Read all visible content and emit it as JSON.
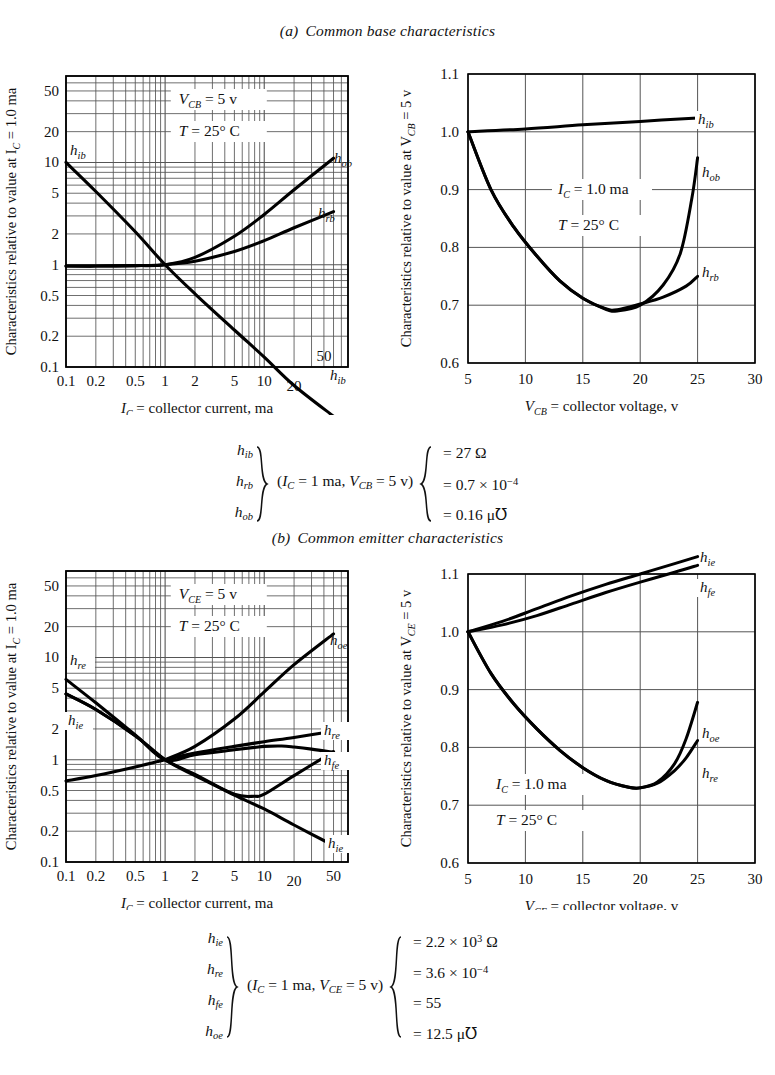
{
  "figure": {
    "panels": [
      {
        "id": "a",
        "label": "(a)",
        "title": "Common base characteristics",
        "left_chart": {
          "ylabel": "Characteristics relative to value at I",
          "ylabel_sub": "C",
          "ylabel_tail": " = 1.0 ma",
          "xlabel": "I",
          "xlabel_sub": "C",
          "xlabel_tail": " = collector current, ma",
          "annotations": [
            {
              "text": "V",
              "sub": "CB",
              "tail": " = 5 v"
            },
            {
              "text": "T",
              "sub": "",
              "tail": " = 25° C"
            }
          ],
          "xticks": [
            "0.1",
            "0.2",
            "0.5",
            "1",
            "2",
            "5",
            "10",
            "20",
            "50"
          ],
          "yticks": [
            "0.1",
            "0.2",
            "0.5",
            "1",
            "2",
            "5",
            "10",
            "20",
            "50"
          ],
          "curve_labels": [
            "h_ib",
            "h_ob",
            "h_rb",
            "h_ib"
          ]
        },
        "right_chart": {
          "ylabel": "Characteristics relative to value at V",
          "ylabel_sub": "CB",
          "ylabel_tail": " = 5 v",
          "xlabel": "V",
          "xlabel_sub": "CB",
          "xlabel_tail": " = collector voltage, v",
          "annotations": [
            {
              "text": "I",
              "sub": "C",
              "tail": " = 1.0 ma"
            },
            {
              "text": "T",
              "sub": "",
              "tail": " = 25° C"
            }
          ],
          "xticks": [
            "5",
            "10",
            "15",
            "20",
            "25",
            "30"
          ],
          "yticks": [
            "0.6",
            "0.7",
            "0.8",
            "0.9",
            "1.0",
            "1.1"
          ],
          "curve_labels": [
            "h_ib",
            "h_ob",
            "h_rb"
          ]
        },
        "legend": {
          "params": [
            {
              "h": "h",
              "sub": "ib"
            },
            {
              "h": "h",
              "sub": "rb"
            },
            {
              "h": "h",
              "sub": "ob"
            }
          ],
          "condition_pre": "(I",
          "condition_sub1": "C",
          "condition_mid": " = 1 ma, V",
          "condition_sub2": "CB",
          "condition_post": " = 5 v)",
          "values": [
            {
              "eq": "= 27 Ω"
            },
            {
              "eq": "= 0.7 × 10",
              "sup": "−4"
            },
            {
              "eq": "= 0.16 μ℧"
            }
          ]
        }
      },
      {
        "id": "b",
        "label": "(b)",
        "title": "Common emitter characteristics",
        "left_chart": {
          "ylabel": "Characteristics relative to value at I",
          "ylabel_sub": "C",
          "ylabel_tail": " = 1.0 ma",
          "xlabel": "I",
          "xlabel_sub": "C",
          "xlabel_tail": " = collector current, ma",
          "annotations": [
            {
              "text": "V",
              "sub": "CE",
              "tail": " = 5 v"
            },
            {
              "text": "T",
              "sub": "",
              "tail": " = 25° C"
            }
          ],
          "xticks": [
            "0.1",
            "0.2",
            "0.5",
            "1",
            "2",
            "5",
            "10",
            "20",
            "50"
          ],
          "yticks": [
            "0.1",
            "0.2",
            "0.5",
            "1",
            "2",
            "5",
            "10",
            "20",
            "50"
          ],
          "curve_labels": [
            "h_re",
            "h_ie",
            "h_oe",
            "h_re",
            "h_fe",
            "h_ie"
          ]
        },
        "right_chart": {
          "ylabel": "Characteristics relative to value at V",
          "ylabel_sub": "CE",
          "ylabel_tail": " = 5 v",
          "xlabel": "V",
          "xlabel_sub": "CE",
          "xlabel_tail": " = collector voltage, v",
          "annotations": [
            {
              "text": "I",
              "sub": "C",
              "tail": " = 1.0 ma"
            },
            {
              "text": "T",
              "sub": "",
              "tail": " = 25° C"
            }
          ],
          "xticks": [
            "5",
            "10",
            "15",
            "20",
            "25",
            "30"
          ],
          "yticks": [
            "0.6",
            "0.7",
            "0.8",
            "0.9",
            "1.0",
            "1.1"
          ],
          "curve_labels": [
            "h_ie",
            "h_fe",
            "h_oe",
            "h_re"
          ]
        },
        "legend": {
          "params": [
            {
              "h": "h",
              "sub": "ie"
            },
            {
              "h": "h",
              "sub": "re"
            },
            {
              "h": "h",
              "sub": "fe"
            },
            {
              "h": "h",
              "sub": "oe"
            }
          ],
          "condition_pre": "(I",
          "condition_sub1": "C",
          "condition_mid": " = 1 ma, V",
          "condition_sub2": "CE",
          "condition_post": " = 5 v)",
          "values": [
            {
              "eq": "= 2.2 × 10",
              "sup": "3",
              "tail": " Ω"
            },
            {
              "eq": "= 3.6 × 10",
              "sup": "−4"
            },
            {
              "eq": "= 55"
            },
            {
              "eq": "= 12.5 μ℧"
            }
          ]
        }
      }
    ]
  },
  "chart_data": [
    {
      "id": "a-left",
      "type": "line",
      "title": "Common base characteristics — vs collector current",
      "xlabel": "I_C = collector current, ma",
      "ylabel": "Characteristics relative to value at I_C = 1.0 ma",
      "xscale": "log",
      "yscale": "log",
      "xlim": [
        0.1,
        70
      ],
      "ylim": [
        0.1,
        70
      ],
      "xticks": [
        0.1,
        0.2,
        0.5,
        1,
        2,
        5,
        10,
        20,
        50
      ],
      "yticks": [
        0.1,
        0.2,
        0.5,
        1,
        2,
        5,
        10,
        20,
        50
      ],
      "grid": true,
      "annotations": [
        "V_CB = 5 v",
        "T = 25° C"
      ],
      "series": [
        {
          "name": "h_ib",
          "label_left": "h_ib",
          "label_right": "h_ib",
          "x": [
            0.1,
            0.2,
            0.5,
            1,
            2,
            5,
            10,
            20,
            50
          ],
          "y": [
            10.0,
            5.2,
            2.1,
            1.0,
            0.52,
            0.23,
            0.125,
            0.066,
            0.033
          ]
        },
        {
          "name": "h_ob",
          "label_right": "h_ob",
          "x": [
            0.1,
            0.2,
            0.5,
            1,
            2,
            5,
            10,
            20,
            50
          ],
          "y": [
            0.97,
            0.97,
            0.98,
            1.0,
            1.18,
            1.9,
            3.1,
            5.4,
            11.0
          ]
        },
        {
          "name": "h_rb",
          "label_right": "h_rb",
          "x": [
            0.1,
            0.2,
            0.5,
            1,
            2,
            5,
            10,
            20,
            50
          ],
          "y": [
            0.97,
            0.97,
            0.98,
            1.0,
            1.08,
            1.35,
            1.72,
            2.3,
            3.3
          ]
        }
      ]
    },
    {
      "id": "a-right",
      "type": "line",
      "title": "Common base characteristics — vs collector voltage",
      "xlabel": "V_CB = collector voltage, v",
      "ylabel": "Characteristics relative to value at V_CB = 5 v",
      "xscale": "linear",
      "yscale": "linear",
      "xlim": [
        5,
        30
      ],
      "ylim": [
        0.6,
        1.1
      ],
      "xticks": [
        5,
        10,
        15,
        20,
        25,
        30
      ],
      "yticks": [
        0.6,
        0.7,
        0.8,
        0.9,
        1.0,
        1.1
      ],
      "grid": true,
      "annotations": [
        "I_C = 1.0 ma",
        "T = 25° C"
      ],
      "series": [
        {
          "name": "h_ib",
          "label_right": "h_ib",
          "x": [
            5,
            10,
            15,
            20,
            25
          ],
          "y": [
            1.0,
            1.005,
            1.012,
            1.018,
            1.024
          ]
        },
        {
          "name": "h_ob",
          "label_right": "h_ob",
          "x": [
            5,
            7,
            9,
            11,
            13,
            15,
            17,
            18,
            20,
            22,
            23.5,
            24.5,
            25
          ],
          "y": [
            1.0,
            0.9,
            0.835,
            0.785,
            0.742,
            0.712,
            0.693,
            0.69,
            0.7,
            0.735,
            0.79,
            0.885,
            0.955
          ]
        },
        {
          "name": "h_rb",
          "label_right": "h_rb",
          "x": [
            5,
            7,
            9,
            11,
            13,
            15,
            17,
            18,
            20,
            22,
            24,
            25
          ],
          "y": [
            1.0,
            0.9,
            0.835,
            0.785,
            0.742,
            0.712,
            0.694,
            0.692,
            0.702,
            0.714,
            0.733,
            0.75
          ]
        }
      ]
    },
    {
      "id": "b-left",
      "type": "line",
      "title": "Common emitter characteristics — vs collector current",
      "xlabel": "I_C = collector current, ma",
      "ylabel": "Characteristics relative to value at I_C = 1.0 ma",
      "xscale": "log",
      "yscale": "log",
      "xlim": [
        0.1,
        70
      ],
      "ylim": [
        0.1,
        70
      ],
      "xticks": [
        0.1,
        0.2,
        0.5,
        1,
        2,
        5,
        10,
        20,
        50
      ],
      "yticks": [
        0.1,
        0.2,
        0.5,
        1,
        2,
        5,
        10,
        20,
        50
      ],
      "grid": true,
      "annotations": [
        "V_CE = 5 v",
        "T = 25° C"
      ],
      "series": [
        {
          "name": "h_re",
          "label_left": "h_re",
          "label_right": "h_re",
          "x": [
            0.1,
            0.2,
            0.5,
            1,
            2,
            5,
            8,
            10,
            15,
            20,
            30,
            50
          ],
          "y": [
            6.1,
            3.6,
            1.75,
            1.0,
            1.12,
            1.25,
            1.32,
            1.35,
            1.36,
            1.33,
            1.27,
            1.18
          ]
        },
        {
          "name": "h_ie",
          "label_left": "h_ie",
          "label_right": "h_ie",
          "x": [
            0.1,
            0.2,
            0.5,
            1,
            2,
            5,
            10,
            20,
            50
          ],
          "y": [
            0.62,
            0.7,
            0.85,
            1.0,
            1.16,
            1.35,
            1.5,
            1.65,
            1.9
          ]
        },
        {
          "name": "h_oe",
          "label_right": "h_oe",
          "x": [
            0.1,
            0.2,
            0.5,
            1,
            2,
            5,
            10,
            20,
            50
          ],
          "y": [
            4.4,
            3.1,
            1.72,
            1.0,
            0.72,
            0.45,
            0.33,
            0.23,
            0.145
          ]
        },
        {
          "name": "h_fe",
          "label_right": "h_fe",
          "x": [
            0.1,
            0.2,
            0.5,
            1,
            2,
            5,
            8,
            10,
            20,
            50
          ],
          "y": [
            4.4,
            3.1,
            1.72,
            1.0,
            0.7,
            0.46,
            0.44,
            0.46,
            0.7,
            1.2
          ]
        },
        {
          "name": "h_oe_rise",
          "label_right": "",
          "x": [
            1,
            2,
            5,
            10,
            20,
            50
          ],
          "y": [
            1.0,
            1.35,
            2.5,
            4.6,
            8.5,
            17.0
          ]
        }
      ]
    },
    {
      "id": "b-right",
      "type": "line",
      "title": "Common emitter characteristics — vs collector voltage",
      "xlabel": "V_CE = collector voltage, v",
      "ylabel": "Characteristics relative to value at V_CE = 5 v",
      "xscale": "linear",
      "yscale": "linear",
      "xlim": [
        5,
        30
      ],
      "ylim": [
        0.6,
        1.1
      ],
      "xticks": [
        5,
        10,
        15,
        20,
        25,
        30
      ],
      "yticks": [
        0.6,
        0.7,
        0.8,
        0.9,
        1.0,
        1.1
      ],
      "grid": true,
      "annotations": [
        "I_C = 1.0 ma",
        "T = 25° C"
      ],
      "series": [
        {
          "name": "h_ie",
          "label_right": "h_ie",
          "x": [
            5,
            8,
            11,
            14,
            17,
            20,
            23,
            25
          ],
          "y": [
            1.0,
            1.018,
            1.04,
            1.062,
            1.082,
            1.1,
            1.118,
            1.13
          ]
        },
        {
          "name": "h_fe",
          "label_right": "h_fe",
          "x": [
            5,
            8,
            11,
            14,
            17,
            20,
            23,
            25
          ],
          "y": [
            1.0,
            1.012,
            1.028,
            1.048,
            1.068,
            1.086,
            1.103,
            1.115
          ]
        },
        {
          "name": "h_oe",
          "label_right": "h_oe",
          "x": [
            5,
            7,
            9,
            11,
            13,
            15,
            17,
            19,
            20,
            21.5,
            23,
            24,
            25
          ],
          "y": [
            1.0,
            0.928,
            0.875,
            0.832,
            0.795,
            0.765,
            0.743,
            0.731,
            0.73,
            0.74,
            0.772,
            0.815,
            0.878
          ]
        },
        {
          "name": "h_re",
          "label_right": "h_re",
          "x": [
            5,
            7,
            9,
            11,
            13,
            15,
            17,
            19,
            20,
            21.5,
            23,
            24,
            25
          ],
          "y": [
            1.0,
            0.928,
            0.875,
            0.832,
            0.795,
            0.765,
            0.743,
            0.731,
            0.73,
            0.738,
            0.76,
            0.782,
            0.812
          ]
        }
      ]
    }
  ]
}
